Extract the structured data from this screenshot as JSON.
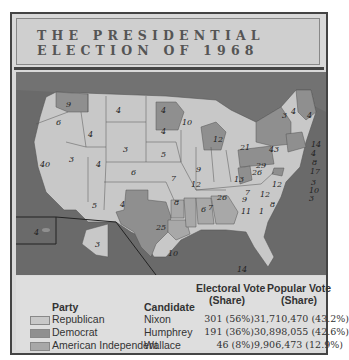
{
  "title": {
    "line1": "THE PRESIDENTIAL",
    "line2": "ELECTION OF 1968"
  },
  "colors": {
    "republican": "#c8c8c8",
    "democrat": "#8f8f8f",
    "american_independent": "#a8a8a8",
    "ocean": "#6a6a6a",
    "canada": "#727272"
  },
  "map": {
    "state_labels": [
      {
        "state": "WA",
        "ev": "9",
        "party": "democrat"
      },
      {
        "state": "OR",
        "ev": "6",
        "party": "republican"
      },
      {
        "state": "CA",
        "ev": "40",
        "party": "republican"
      },
      {
        "state": "ID",
        "ev": "4",
        "party": "republican"
      },
      {
        "state": "NV",
        "ev": "3",
        "party": "republican"
      },
      {
        "state": "MT",
        "ev": "4",
        "party": "republican"
      },
      {
        "state": "WY",
        "ev": "3",
        "party": "republican"
      },
      {
        "state": "UT",
        "ev": "4",
        "party": "republican"
      },
      {
        "state": "AZ",
        "ev": "5",
        "party": "republican"
      },
      {
        "state": "CO",
        "ev": "6",
        "party": "republican"
      },
      {
        "state": "NM",
        "ev": "4",
        "party": "republican"
      },
      {
        "state": "ND",
        "ev": "4",
        "party": "republican"
      },
      {
        "state": "SD",
        "ev": "4",
        "party": "republican"
      },
      {
        "state": "NE",
        "ev": "5",
        "party": "republican"
      },
      {
        "state": "KS",
        "ev": "7",
        "party": "republican"
      },
      {
        "state": "OK",
        "ev": "8",
        "party": "republican"
      },
      {
        "state": "TX",
        "ev": "25",
        "party": "democrat"
      },
      {
        "state": "MN",
        "ev": "10",
        "party": "democrat"
      },
      {
        "state": "IA",
        "ev": "9",
        "party": "republican"
      },
      {
        "state": "MO",
        "ev": "12",
        "party": "republican"
      },
      {
        "state": "AR",
        "ev": "6",
        "party": "american_independent"
      },
      {
        "state": "LA",
        "ev": "10",
        "party": "american_independent"
      },
      {
        "state": "WI",
        "ev": "12",
        "party": "republican"
      },
      {
        "state": "IL",
        "ev": "26",
        "party": "republican"
      },
      {
        "state": "MI",
        "ev": "21",
        "party": "democrat"
      },
      {
        "state": "IN",
        "ev": "13",
        "party": "republican"
      },
      {
        "state": "OH",
        "ev": "26",
        "party": "republican"
      },
      {
        "state": "KY",
        "ev": "9",
        "party": "republican"
      },
      {
        "state": "TN",
        "ev": "11",
        "party": "republican"
      },
      {
        "state": "MS",
        "ev": "7",
        "party": "american_independent"
      },
      {
        "state": "AL",
        "ev": "10",
        "party": "american_independent"
      },
      {
        "state": "GA",
        "ev": "12",
        "party": "american_independent"
      },
      {
        "state": "FL",
        "ev": "14",
        "party": "republican"
      },
      {
        "state": "SC",
        "ev": "8",
        "party": "republican"
      },
      {
        "state": "NC",
        "ev": "12",
        "party": "republican"
      },
      {
        "state": "NC-faithless",
        "ev": "1",
        "party": "american_independent"
      },
      {
        "state": "VA",
        "ev": "12",
        "party": "republican"
      },
      {
        "state": "WV",
        "ev": "7",
        "party": "democrat"
      },
      {
        "state": "PA",
        "ev": "29",
        "party": "democrat"
      },
      {
        "state": "NY",
        "ev": "43",
        "party": "democrat"
      },
      {
        "state": "VT",
        "ev": "3",
        "party": "republican"
      },
      {
        "state": "NH",
        "ev": "4",
        "party": "republican"
      },
      {
        "state": "ME",
        "ev": "4",
        "party": "democrat"
      },
      {
        "state": "MA",
        "ev": "14",
        "party": "democrat"
      },
      {
        "state": "RI",
        "ev": "4",
        "party": "democrat"
      },
      {
        "state": "CT",
        "ev": "8",
        "party": "democrat"
      },
      {
        "state": "NJ",
        "ev": "17",
        "party": "republican"
      },
      {
        "state": "DE",
        "ev": "3",
        "party": "republican"
      },
      {
        "state": "MD",
        "ev": "10",
        "party": "democrat"
      },
      {
        "state": "DC",
        "ev": "3",
        "party": "democrat"
      },
      {
        "state": "HI",
        "ev": "4",
        "party": "democrat"
      },
      {
        "state": "AK",
        "ev": "3",
        "party": "republican"
      }
    ]
  },
  "legend": {
    "headers": {
      "party": "Party",
      "candidate": "Candidate",
      "electoral_l1": "Electoral Vote",
      "electoral_l2": "(Share)",
      "popular_l1": "Popular Vote",
      "popular_l2": "(Share)"
    },
    "rows": [
      {
        "party": "Republican",
        "candidate": "Nixon",
        "electoral": "301 (56%)",
        "popular": "31,710,470 (43.2%)",
        "color": "#c8c8c8"
      },
      {
        "party": "Democrat",
        "candidate": "Humphrey",
        "electoral": "191 (36%)",
        "popular": "30,898,055 (42.6%)",
        "color": "#8f8f8f"
      },
      {
        "party": "American Independent",
        "candidate": "Wallace",
        "electoral": "46 (8%)",
        "popular": "9,906,473 (12.9%)",
        "color": "#a8a8a8"
      }
    ]
  }
}
